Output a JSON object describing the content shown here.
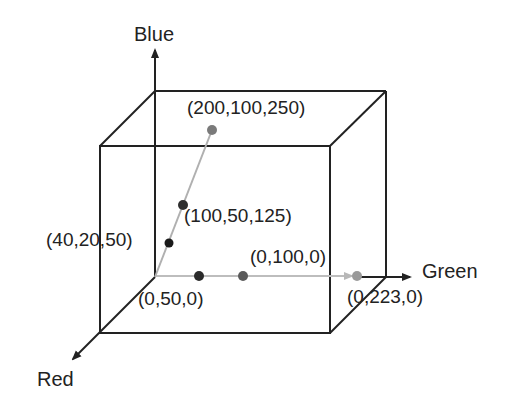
{
  "diagram": {
    "axes": {
      "blue": {
        "label": "Blue",
        "x": 134,
        "y": 24
      },
      "green": {
        "label": "Green",
        "x": 422,
        "y": 261
      },
      "red": {
        "label": "Red",
        "x": 37,
        "y": 369
      }
    },
    "points": [
      {
        "label": "(200,100,250)",
        "rgb": [
          200,
          100,
          250
        ],
        "dot_x": 212,
        "dot_y": 130,
        "dot_color": "#7a7a7a",
        "label_x": 187,
        "label_y": 98
      },
      {
        "label": "(100,50,125)",
        "rgb": [
          100,
          50,
          125
        ],
        "dot_x": 183,
        "dot_y": 205,
        "dot_color": "#2e2e2e",
        "label_x": 184,
        "label_y": 206
      },
      {
        "label": "(40,20,50)",
        "rgb": [
          40,
          20,
          50
        ],
        "dot_x": 169,
        "dot_y": 243,
        "dot_color": "#1a1a1a",
        "label_x": 46,
        "label_y": 230
      },
      {
        "label": "(0,50,0)",
        "rgb": [
          0,
          50,
          0
        ],
        "dot_x": 199,
        "dot_y": 276,
        "dot_color": "#2a2a2a",
        "label_x": 138,
        "label_y": 289
      },
      {
        "label": "(0,100,0)",
        "rgb": [
          0,
          100,
          0
        ],
        "dot_x": 243,
        "dot_y": 276,
        "dot_color": "#5a5a5a",
        "label_x": 250,
        "label_y": 247
      },
      {
        "label": "(0,223,0)",
        "rgb": [
          0,
          223,
          0
        ],
        "dot_x": 357,
        "dot_y": 276,
        "dot_color": "#9a9a9a",
        "label_x": 347,
        "label_y": 287
      }
    ],
    "colors": {
      "cube_edge": "#222222",
      "gray_line": "#b0b0b0",
      "text": "#222222"
    }
  }
}
